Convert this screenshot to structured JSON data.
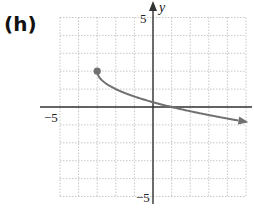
{
  "panel_label": "(h)",
  "chart_data": {
    "type": "line",
    "title": "",
    "xlabel": "",
    "ylabel": "y",
    "xlim": [
      -5,
      5
    ],
    "ylim": [
      -5,
      5
    ],
    "grid": true,
    "grid_step": 1,
    "tick_labels": {
      "x": [
        "-5"
      ],
      "y": [
        "5",
        "-5"
      ]
    },
    "series": [
      {
        "name": "curve",
        "function": "y = -sqrt(x+3) + 2",
        "start_point": {
          "x": -3,
          "y": 2,
          "closed": true
        },
        "end_arrow": true,
        "x": [
          -3,
          -2,
          -1,
          0,
          1,
          2,
          3,
          4,
          4.9
        ],
        "values": [
          2,
          1,
          0,
          -0.27,
          -1,
          -1.24,
          -1.45,
          -1.65,
          -0.81
        ]
      }
    ],
    "colors": {
      "curve": "#707070",
      "axes": "#333333",
      "grid": "#b0b0b0"
    }
  },
  "labels": {
    "x_min": "−5",
    "y_max": "5",
    "y_min": "−5",
    "y_axis": "y"
  }
}
